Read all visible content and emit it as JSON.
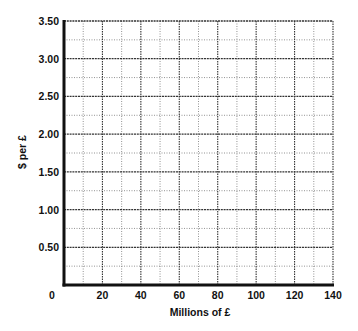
{
  "chart_data": {
    "type": "line",
    "title": "",
    "xlabel": "Millions of £",
    "ylabel": "$ per £",
    "xlim": [
      0,
      140
    ],
    "ylim": [
      0,
      3.5
    ],
    "x_ticks": [
      0,
      20,
      40,
      60,
      80,
      100,
      120,
      140
    ],
    "x_tick_labels": [
      "0",
      "20",
      "40",
      "60",
      "80",
      "100",
      "120",
      "140"
    ],
    "y_ticks": [
      0.5,
      1.0,
      1.5,
      2.0,
      2.5,
      3.0,
      3.5
    ],
    "y_tick_labels": [
      "0.50",
      "1.00",
      "1.50",
      "2.00",
      "2.50",
      "3.00",
      "3.50"
    ],
    "origin_label": "0",
    "grid": true,
    "grid_major_x_step": 20,
    "grid_minor_x_step": 10,
    "grid_major_y_step": 0.5,
    "grid_minor_y_step": 0.25,
    "series": [],
    "note": "Blank graph grid with no plotted data"
  },
  "colors": {
    "axis": "#111111",
    "grid_major": "#333333",
    "grid_minor": "#777777",
    "background": "#ffffff"
  }
}
